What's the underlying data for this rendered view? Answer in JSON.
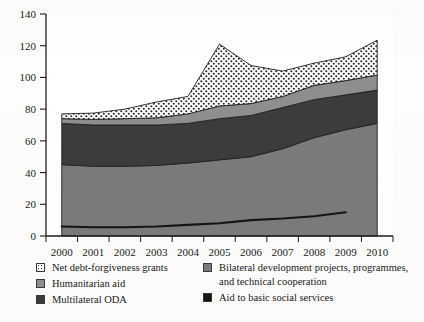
{
  "chart_data": {
    "type": "area",
    "title": "",
    "subtitle": "",
    "xlabel": "",
    "ylabel": "",
    "stacked": true,
    "grid": false,
    "legend_position": "bottom",
    "xlim": [
      1999.5,
      2010.5
    ],
    "ylim": [
      0,
      140
    ],
    "x": [
      2000,
      2001,
      2002,
      2003,
      2004,
      2005,
      2006,
      2007,
      2008,
      2009,
      2010
    ],
    "categories": [
      "2000",
      "2001",
      "2002",
      "2003",
      "2004",
      "2005",
      "2006",
      "2007",
      "2008",
      "2009",
      "2010"
    ],
    "yticks": [
      0,
      20,
      40,
      60,
      80,
      100,
      120,
      140
    ],
    "ytick_labels": [
      "0",
      "20",
      "40",
      "60",
      "80",
      "100",
      "120",
      "140"
    ],
    "series": [
      {
        "name": "Bilateral development projects, programmes, and technical cooperation",
        "type": "area",
        "color": "#7b7b7b",
        "values": [
          45,
          44,
          44,
          44.5,
          46,
          48,
          50,
          55,
          62,
          67,
          71
        ]
      },
      {
        "name": "Multilateral ODA",
        "type": "area",
        "color": "#3c3c3c",
        "values": [
          26,
          26,
          26,
          25.5,
          25,
          26,
          26,
          26,
          24,
          22,
          21
        ]
      },
      {
        "name": "Humanitarian aid",
        "type": "area",
        "color": "#8e8e8e",
        "values": [
          3,
          3.5,
          4,
          4.5,
          6,
          8,
          7.5,
          7,
          9,
          9,
          9.5
        ]
      },
      {
        "name": "Net debt-forgiveness grants",
        "type": "area",
        "color": "#ffffff",
        "pattern": "dots",
        "values": [
          3,
          4,
          6,
          10,
          11,
          39,
          24,
          16,
          14,
          15,
          22
        ]
      },
      {
        "name": "Aid to basic social services",
        "type": "line",
        "color": "#151515",
        "values": [
          6,
          5.5,
          5.5,
          6,
          7,
          8,
          10,
          11,
          12.5,
          15,
          null
        ]
      }
    ],
    "totals": [
      77,
      77.5,
      80,
      84.5,
      88,
      121,
      107.5,
      104,
      109,
      113,
      123.5
    ]
  },
  "legend": {
    "columns": [
      {
        "items": [
          {
            "swatch": "dotted-pattern",
            "label": "Net debt-forgiveness grants"
          },
          {
            "swatch": "medium-gray",
            "label": "Humanitarian aid"
          },
          {
            "swatch": "dark-gray",
            "label": "Multilateral ODA"
          }
        ]
      },
      {
        "items": [
          {
            "swatch": "bilateral-gray",
            "label": "Bilateral development projects, programmes, and technical cooperation"
          },
          {
            "swatch": "black",
            "label": "Aid to basic social services"
          }
        ]
      }
    ]
  }
}
